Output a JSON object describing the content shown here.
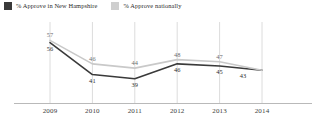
{
  "legend": {
    "items": [
      {
        "label": "% Approve in New Hampshire",
        "color": "#3a3a3a",
        "key": "nh",
        "icon": "legend-swatch"
      },
      {
        "label": "% Approve nationally",
        "color": "#c9c9c9",
        "key": "national",
        "icon": "legend-swatch"
      }
    ]
  },
  "axis": {
    "ticks": [
      "2009",
      "2010",
      "2011",
      "2012",
      "2013",
      "2014"
    ]
  },
  "chart_data": {
    "type": "line",
    "title": "",
    "xlabel": "",
    "ylabel": "",
    "categories": [
      "2009",
      "2010",
      "2011",
      "2012",
      "2013",
      "2014"
    ],
    "ylim": [
      30,
      60
    ],
    "grid": "vertical",
    "legend_position": "top-left",
    "series": [
      {
        "name": "% Approve in New Hampshire",
        "key": "nh",
        "color": "#3a3a3a",
        "values": [
          56,
          41,
          39,
          46,
          45,
          43
        ],
        "labels": [
          "56",
          "41",
          "39",
          "46",
          "45",
          "43"
        ]
      },
      {
        "name": "% Approve nationally",
        "key": "national",
        "color": "#c9c9c9",
        "values": [
          57,
          46,
          44,
          48,
          47,
          43
        ],
        "labels": [
          "57",
          "46",
          "44",
          "48",
          "47",
          "43"
        ]
      }
    ]
  }
}
